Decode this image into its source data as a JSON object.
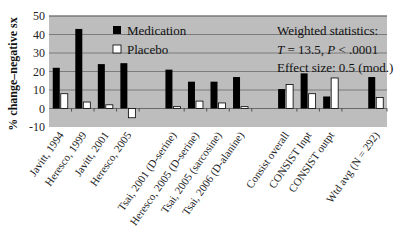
{
  "chart_data": {
    "type": "bar",
    "title": "",
    "xlabel": "",
    "ylabel": "% change–negative sx",
    "ylim": [
      -10,
      50
    ],
    "yticks": [
      -10,
      0,
      10,
      20,
      30,
      40,
      50
    ],
    "grid": true,
    "legend_position": "upper-left-inside",
    "categories": [
      "Javitt, 1994",
      "Heresco, 1999",
      "Javitt, 2001",
      "Heresco, 2005",
      "Tsai, 2001 (D-serine)",
      "Heresco, 2005 (D-serine)",
      "Tsai, 2005 (sarcosine)",
      "Tsai, 2006 (D-alanine)",
      "Consist overall",
      "CONSIST Inpt",
      "CONSIST outpt",
      "Wtd avg (N = 292)"
    ],
    "groups": [
      [
        0,
        1,
        2,
        3
      ],
      [
        4,
        5,
        6,
        7
      ],
      [
        8,
        9,
        10
      ],
      [
        11
      ]
    ],
    "series": [
      {
        "name": "Medication",
        "color": "#000000",
        "values": [
          22,
          43,
          24,
          24.5,
          21,
          14.5,
          14.5,
          17,
          10.5,
          19,
          6.5,
          17
        ]
      },
      {
        "name": "Placebo",
        "color": "#ffffff",
        "values": [
          8,
          3.5,
          2,
          -5,
          1,
          4,
          3,
          1,
          13,
          8,
          16.5,
          6
        ]
      }
    ],
    "annotations": [
      "Weighted statistics:",
      "T = 13.5,  P < .0001",
      "Effect size:  0.5 (mod.)"
    ]
  },
  "axis": {
    "ylabel": "% change–negative sx",
    "ticks": [
      "50",
      "40",
      "30",
      "20",
      "10",
      "0",
      "-10"
    ]
  },
  "legend": {
    "medication": "Medication",
    "placebo": "Placebo"
  },
  "stats": {
    "line1": "Weighted statistics:",
    "line2_T": "T",
    "line2_rest": " = 13.5,  ",
    "line2_P": "P",
    "line2_end": " < .0001",
    "line3": "Effect size:  0.5 (mod.)"
  }
}
